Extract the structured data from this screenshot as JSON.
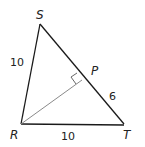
{
  "figure": {
    "type": "triangle",
    "vertices": {
      "S": {
        "label": "S"
      },
      "R": {
        "label": "R"
      },
      "T": {
        "label": "T"
      },
      "P": {
        "label": "P"
      }
    },
    "side_labels": {
      "RS": "10",
      "RT": "10",
      "PT": "6"
    },
    "annotations": {
      "right_angle_at": "P",
      "segment_RP": "altitude from R to ST"
    },
    "colors": {
      "triangle_stroke": "#1a1a1a",
      "altitude_stroke": "#8a8a8a",
      "text": "#222222"
    }
  }
}
